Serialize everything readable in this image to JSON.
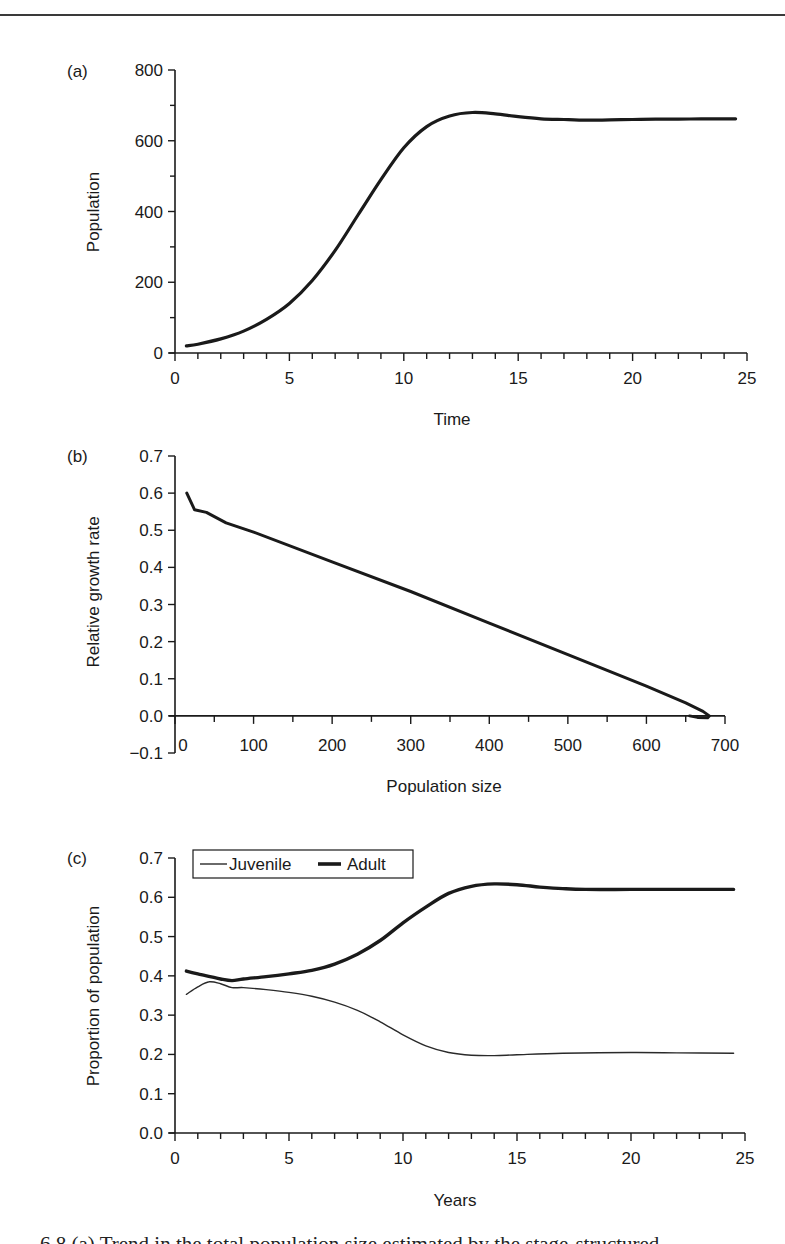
{
  "chart_data": [
    {
      "panel": "(a)",
      "type": "line",
      "title": "",
      "xlabel": "Time",
      "ylabel": "Population",
      "xlim": [
        0,
        25
      ],
      "ylim": [
        0,
        800
      ],
      "xticks": [
        0,
        5,
        10,
        15,
        20,
        25
      ],
      "yticks": [
        0,
        200,
        400,
        600,
        800
      ],
      "grid": false,
      "series": [
        {
          "name": "Population",
          "x": [
            0.5,
            1,
            2,
            3,
            4,
            5,
            6,
            7,
            8,
            9,
            10,
            11,
            12,
            13,
            14,
            15,
            16,
            17,
            18,
            19,
            20,
            21,
            22,
            23,
            24,
            24.5
          ],
          "y": [
            20,
            25,
            40,
            62,
            95,
            140,
            205,
            290,
            390,
            490,
            580,
            640,
            670,
            680,
            676,
            668,
            662,
            660,
            658,
            659,
            660,
            661,
            661,
            662,
            662,
            662
          ]
        }
      ]
    },
    {
      "panel": "(b)",
      "type": "line",
      "title": "",
      "xlabel": "Population size",
      "ylabel": "Relative growth rate",
      "xlim": [
        0,
        700
      ],
      "ylim": [
        -0.1,
        0.7
      ],
      "xticks": [
        0,
        100,
        200,
        300,
        400,
        500,
        600,
        700
      ],
      "yticks": [
        -0.1,
        0.0,
        0.1,
        0.2,
        0.3,
        0.4,
        0.5,
        0.6,
        0.7
      ],
      "grid": false,
      "series": [
        {
          "name": "Relative growth rate",
          "x": [
            15,
            25,
            40,
            65,
            100,
            200,
            300,
            400,
            500,
            600,
            650,
            672,
            680,
            678,
            665,
            655
          ],
          "y": [
            0.6,
            0.555,
            0.548,
            0.52,
            0.495,
            0.415,
            0.335,
            0.25,
            0.165,
            0.08,
            0.035,
            0.012,
            0.0,
            -0.005,
            -0.004,
            0.0
          ]
        }
      ]
    },
    {
      "panel": "(c)",
      "type": "line",
      "title": "",
      "xlabel": "Years",
      "ylabel": "Proportion of population",
      "xlim": [
        0,
        25
      ],
      "ylim": [
        0.0,
        0.7
      ],
      "xticks": [
        0,
        5,
        10,
        15,
        20,
        25
      ],
      "yticks": [
        0.0,
        0.1,
        0.2,
        0.3,
        0.4,
        0.5,
        0.6,
        0.7
      ],
      "grid": false,
      "legend": {
        "position": "top-left",
        "entries": [
          "Juvenile",
          "Adult"
        ]
      },
      "series": [
        {
          "name": "Juvenile",
          "style": "thin",
          "x": [
            0.5,
            1,
            1.5,
            2,
            2.5,
            3,
            4,
            5,
            6,
            7,
            8,
            9,
            10,
            11,
            12,
            13,
            14,
            15,
            17,
            20,
            22,
            24.5
          ],
          "y": [
            0.353,
            0.372,
            0.385,
            0.38,
            0.37,
            0.37,
            0.365,
            0.358,
            0.348,
            0.333,
            0.312,
            0.283,
            0.25,
            0.222,
            0.205,
            0.198,
            0.197,
            0.199,
            0.203,
            0.205,
            0.204,
            0.203
          ]
        },
        {
          "name": "Adult",
          "style": "thick",
          "x": [
            0.5,
            1,
            2,
            2.5,
            3,
            4,
            5,
            6,
            7,
            8,
            9,
            10,
            11,
            12,
            13,
            14,
            15,
            16,
            17,
            18,
            20,
            22,
            24.5
          ],
          "y": [
            0.412,
            0.405,
            0.392,
            0.388,
            0.392,
            0.398,
            0.405,
            0.414,
            0.43,
            0.455,
            0.49,
            0.535,
            0.575,
            0.61,
            0.628,
            0.634,
            0.632,
            0.626,
            0.622,
            0.62,
            0.62,
            0.62,
            0.62
          ]
        }
      ]
    }
  ],
  "panels": {
    "a": {
      "label": "(a)",
      "ylabel": "Population",
      "xlabel": "Time",
      "yticks": [
        "0",
        "200",
        "400",
        "600",
        "800"
      ],
      "xticks": [
        "0",
        "5",
        "10",
        "15",
        "20",
        "25"
      ]
    },
    "b": {
      "label": "(b)",
      "ylabel": "Relative growth rate",
      "xlabel": "Population size",
      "yticks": [
        "−0.1",
        "0.0",
        "0.1",
        "0.2",
        "0.3",
        "0.4",
        "0.5",
        "0.6",
        "0.7"
      ],
      "xticks": [
        "0",
        "100",
        "200",
        "300",
        "400",
        "500",
        "600",
        "700"
      ]
    },
    "c": {
      "label": "(c)",
      "ylabel": "Proportion of population",
      "xlabel": "Years",
      "yticks": [
        "0.0",
        "0.1",
        "0.2",
        "0.3",
        "0.4",
        "0.5",
        "0.6",
        "0.7"
      ],
      "xticks": [
        "0",
        "5",
        "10",
        "15",
        "20",
        "25"
      ],
      "legend": {
        "juvenile": "Juvenile",
        "adult": "Adult"
      }
    }
  },
  "caption": "6.8   (a) Trend in the total population size estimated by the stage-structured"
}
